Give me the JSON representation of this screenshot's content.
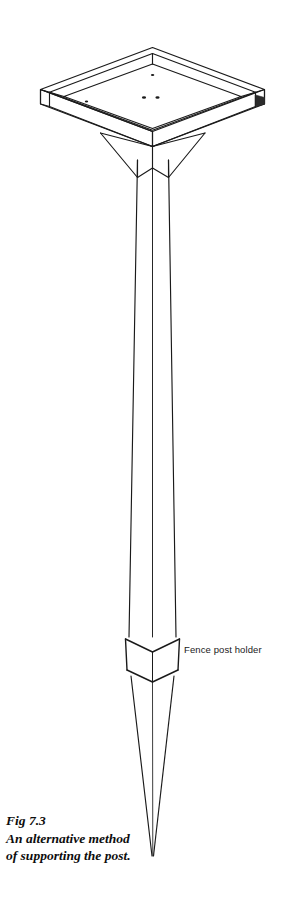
{
  "figure": {
    "domain": "technical-line-drawing",
    "background_color": "#ffffff",
    "line_color": "#1a1a1a",
    "shading_color": "#2b2b2b",
    "subject": "fence post holder",
    "view": "isometric"
  },
  "annotations": {
    "part_label": "Fence post holder"
  },
  "caption": {
    "figure_number": "Fig 7.3",
    "line_two": "An alternative method",
    "line_three": "of supporting the post."
  },
  "parts": {
    "socket_cup": "square socket cup",
    "gusset_web": "gusset web",
    "shaft": "square section shaft",
    "collar": "collar band",
    "point": "tapered driving point",
    "fixing_holes": "base plate fixing holes"
  }
}
